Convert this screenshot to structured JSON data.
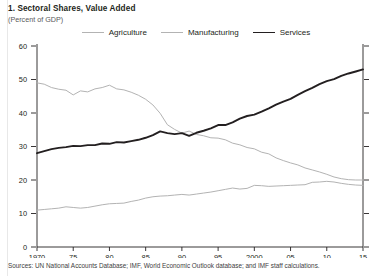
{
  "figure": {
    "title": "1. Sectoral Shares, Value Added",
    "subtitle": "(Percent of GDP)",
    "source": "Sources: UN National Accounts Database; IMF, World Economic Outlook database; and IMF staff calculations."
  },
  "legend": {
    "position": "top-center",
    "items": [
      {
        "label": "Agriculture",
        "color": "#b3b3b3",
        "width": 1.1
      },
      {
        "label": "Manufacturing",
        "color": "#b3b3b3",
        "width": 1.1
      },
      {
        "label": "Services",
        "color": "#231f20",
        "width": 1.9
      }
    ]
  },
  "chart_data": {
    "type": "line",
    "title": "1. Sectoral Shares, Value Added",
    "subtitle": "(Percent of GDP)",
    "xlabel": "",
    "ylabel": "Percent of GDP",
    "xlim": [
      1970,
      2015
    ],
    "ylim": [
      0,
      60
    ],
    "yticks": [
      0,
      10,
      20,
      30,
      40,
      50,
      60
    ],
    "ytick_labels": [
      "0",
      "10",
      "20",
      "30",
      "40",
      "50",
      "60"
    ],
    "xticks": [
      1970,
      1975,
      1980,
      1985,
      1990,
      1995,
      2000,
      2005,
      2010,
      2015
    ],
    "xtick_labels": [
      "1970",
      "75",
      "80",
      "85",
      "90",
      "95",
      "2000",
      "05",
      "10",
      "15"
    ],
    "grid": false,
    "x": [
      1970,
      1971,
      1972,
      1973,
      1974,
      1975,
      1976,
      1977,
      1978,
      1979,
      1980,
      1981,
      1982,
      1983,
      1984,
      1985,
      1986,
      1987,
      1988,
      1989,
      1990,
      1991,
      1992,
      1993,
      1994,
      1995,
      1996,
      1997,
      1998,
      1999,
      2000,
      2001,
      2002,
      2003,
      2004,
      2005,
      2006,
      2007,
      2008,
      2009,
      2010,
      2011,
      2012,
      2013,
      2014,
      2015
    ],
    "series": [
      {
        "name": "Agriculture",
        "color": "#b3b3b3",
        "values": [
          49.0,
          48.6,
          47.6,
          47.1,
          46.8,
          45.4,
          46.6,
          46.3,
          47.2,
          47.6,
          48.3,
          47.2,
          46.9,
          46.2,
          45.3,
          44.1,
          42.4,
          39.9,
          36.5,
          35.1,
          34.0,
          34.6,
          33.6,
          33.2,
          32.6,
          32.5,
          32.0,
          31.0,
          30.5,
          29.7,
          29.3,
          28.3,
          27.8,
          26.6,
          25.8,
          25.1,
          24.5,
          23.6,
          23.0,
          22.4,
          21.7,
          20.9,
          20.4,
          20.1,
          20.0,
          20.0
        ]
      },
      {
        "name": "Manufacturing",
        "color": "#b3b3b3",
        "values": [
          11.0,
          11.2,
          11.4,
          11.6,
          12.0,
          11.8,
          11.6,
          11.8,
          12.2,
          12.6,
          12.9,
          13.0,
          13.1,
          13.6,
          14.0,
          14.6,
          15.0,
          15.2,
          15.3,
          15.5,
          15.7,
          15.5,
          15.8,
          16.1,
          16.4,
          16.8,
          17.2,
          17.6,
          17.3,
          17.5,
          18.4,
          18.3,
          18.1,
          18.2,
          18.3,
          18.4,
          18.5,
          18.6,
          19.3,
          19.4,
          19.6,
          19.4,
          19.0,
          18.7,
          18.5,
          18.4
        ]
      },
      {
        "name": "Services",
        "color": "#231f20",
        "values": [
          28.0,
          28.6,
          29.2,
          29.6,
          29.8,
          30.2,
          30.1,
          30.4,
          30.4,
          30.9,
          30.8,
          31.3,
          31.2,
          31.6,
          32.0,
          32.6,
          33.4,
          34.5,
          34.0,
          33.7,
          34.0,
          33.2,
          34.1,
          34.7,
          35.4,
          36.4,
          36.4,
          37.2,
          38.3,
          39.1,
          39.5,
          40.4,
          41.4,
          42.5,
          43.4,
          44.2,
          45.4,
          46.5,
          47.5,
          48.6,
          49.5,
          50.1,
          51.1,
          51.8,
          52.4,
          53.0
        ]
      }
    ]
  }
}
